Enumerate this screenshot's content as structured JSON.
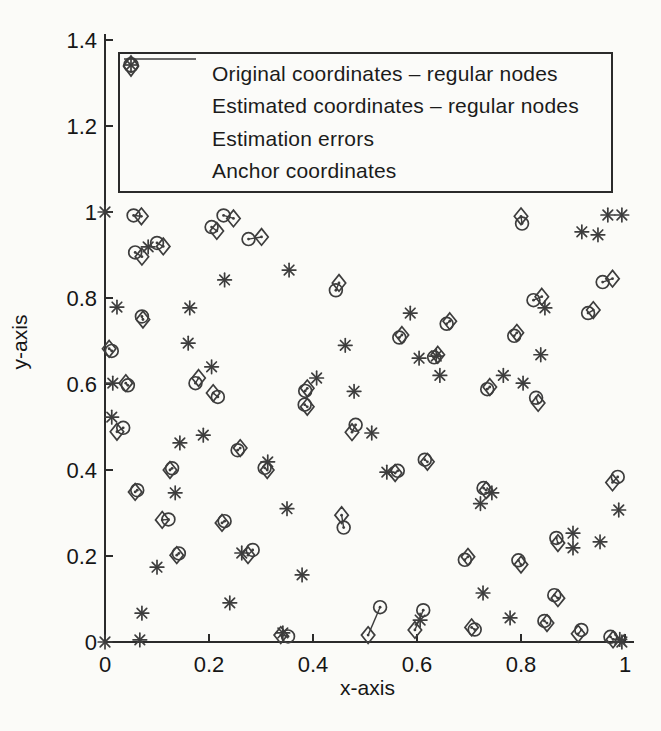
{
  "figure_colors": {
    "background": "#fbfbf8",
    "ink": "#3d3d3d",
    "axis": "#2b2b2b",
    "text": "#161616"
  },
  "chart_data": {
    "type": "scatter",
    "title": "",
    "xlabel": "x-axis",
    "ylabel": "y-axis",
    "xlim": [
      0,
      1.02
    ],
    "ylim": [
      0,
      1.41
    ],
    "grid": false,
    "legend_position": "top-inside",
    "xtick_values": [
      0,
      0.2,
      0.4,
      0.6,
      0.8,
      1
    ],
    "xtick_labels": [
      "0",
      "0.2",
      "0.4",
      "0.6",
      "0.8",
      "1"
    ],
    "ytick_values": [
      0,
      0.2,
      0.4,
      0.6,
      0.8,
      1,
      1.2,
      1.4
    ],
    "ytick_labels": [
      "0",
      "0.2",
      "0.4",
      "0.6",
      "0.8",
      "1",
      "1.2",
      "1.4"
    ],
    "legend_entries": [
      {
        "marker": "diamond",
        "label": "Original coordinates – regular nodes"
      },
      {
        "marker": "circle",
        "label": "Estimated coordinates – regular nodes"
      },
      {
        "marker": "line",
        "label": "Estimation errors"
      },
      {
        "marker": "asterisk",
        "label": "Anchor coordinates"
      }
    ],
    "regular_nodes": [
      {
        "original": [
          0.07,
          0.99
        ],
        "estimated": [
          0.055,
          0.992
        ]
      },
      {
        "original": [
          0.247,
          0.985
        ],
        "estimated": [
          0.228,
          0.992
        ]
      },
      {
        "original": [
          0.215,
          0.956
        ],
        "estimated": [
          0.205,
          0.965
        ]
      },
      {
        "original": [
          0.301,
          0.942
        ],
        "estimated": [
          0.276,
          0.937
        ]
      },
      {
        "original": [
          0.071,
          0.896
        ],
        "estimated": [
          0.058,
          0.906
        ]
      },
      {
        "original": [
          0.112,
          0.92
        ],
        "estimated": [
          0.1,
          0.928
        ]
      },
      {
        "original": [
          0.8,
          0.99
        ],
        "estimated": [
          0.802,
          0.973
        ]
      },
      {
        "original": [
          0.073,
          0.75
        ],
        "estimated": [
          0.071,
          0.757
        ]
      },
      {
        "original": [
          0.008,
          0.682
        ],
        "estimated": [
          0.013,
          0.677
        ]
      },
      {
        "original": [
          0.45,
          0.835
        ],
        "estimated": [
          0.444,
          0.818
        ]
      },
      {
        "original": [
          0.571,
          0.714
        ],
        "estimated": [
          0.566,
          0.708
        ]
      },
      {
        "original": [
          0.663,
          0.746
        ],
        "estimated": [
          0.657,
          0.74
        ]
      },
      {
        "original": [
          0.976,
          0.845
        ],
        "estimated": [
          0.957,
          0.837
        ]
      },
      {
        "original": [
          0.84,
          0.803
        ],
        "estimated": [
          0.824,
          0.795
        ]
      },
      {
        "original": [
          0.939,
          0.772
        ],
        "estimated": [
          0.929,
          0.765
        ]
      },
      {
        "original": [
          0.792,
          0.719
        ],
        "estimated": [
          0.787,
          0.712
        ]
      },
      {
        "original": [
          0.04,
          0.602
        ],
        "estimated": [
          0.044,
          0.597
        ]
      },
      {
        "original": [
          0.18,
          0.614
        ],
        "estimated": [
          0.174,
          0.602
        ]
      },
      {
        "original": [
          0.208,
          0.579
        ],
        "estimated": [
          0.217,
          0.57
        ]
      },
      {
        "original": [
          0.023,
          0.489
        ],
        "estimated": [
          0.035,
          0.498
        ]
      },
      {
        "original": [
          0.26,
          0.451
        ],
        "estimated": [
          0.255,
          0.446
        ]
      },
      {
        "original": [
          0.125,
          0.4
        ],
        "estimated": [
          0.129,
          0.404
        ]
      },
      {
        "original": [
          0.312,
          0.4
        ],
        "estimated": [
          0.307,
          0.405
        ]
      },
      {
        "original": [
          0.058,
          0.349
        ],
        "estimated": [
          0.062,
          0.353
        ]
      },
      {
        "original": [
          0.389,
          0.59
        ],
        "estimated": [
          0.385,
          0.584
        ]
      },
      {
        "original": [
          0.389,
          0.547
        ],
        "estimated": [
          0.384,
          0.552
        ]
      },
      {
        "original": [
          0.475,
          0.488
        ],
        "estimated": [
          0.482,
          0.505
        ]
      },
      {
        "original": [
          0.62,
          0.419
        ],
        "estimated": [
          0.615,
          0.424
        ]
      },
      {
        "original": [
          0.558,
          0.393
        ],
        "estimated": [
          0.563,
          0.398
        ]
      },
      {
        "original": [
          0.64,
          0.668
        ],
        "estimated": [
          0.633,
          0.662
        ]
      },
      {
        "original": [
          0.74,
          0.593
        ],
        "estimated": [
          0.735,
          0.588
        ]
      },
      {
        "original": [
          0.833,
          0.556
        ],
        "estimated": [
          0.829,
          0.568
        ]
      },
      {
        "original": [
          0.733,
          0.353
        ],
        "estimated": [
          0.728,
          0.358
        ]
      },
      {
        "original": [
          0.976,
          0.371
        ],
        "estimated": [
          0.986,
          0.384
        ]
      },
      {
        "original": [
          0.11,
          0.284
        ],
        "estimated": [
          0.122,
          0.285
        ]
      },
      {
        "original": [
          0.225,
          0.277
        ],
        "estimated": [
          0.23,
          0.281
        ]
      },
      {
        "original": [
          0.138,
          0.202
        ],
        "estimated": [
          0.142,
          0.206
        ]
      },
      {
        "original": [
          0.275,
          0.202
        ],
        "estimated": [
          0.284,
          0.214
        ]
      },
      {
        "original": [
          0.455,
          0.295
        ],
        "estimated": [
          0.459,
          0.266
        ]
      },
      {
        "original": [
          0.506,
          0.016
        ],
        "estimated": [
          0.529,
          0.081
        ]
      },
      {
        "original": [
          0.596,
          0.028
        ],
        "estimated": [
          0.612,
          0.074
        ]
      },
      {
        "original": [
          0.338,
          0.016
        ],
        "estimated": [
          0.352,
          0.013
        ]
      },
      {
        "original": [
          0.698,
          0.198
        ],
        "estimated": [
          0.692,
          0.191
        ]
      },
      {
        "original": [
          0.8,
          0.18
        ],
        "estimated": [
          0.795,
          0.19
        ]
      },
      {
        "original": [
          0.871,
          0.23
        ],
        "estimated": [
          0.868,
          0.242
        ]
      },
      {
        "original": [
          0.871,
          0.102
        ],
        "estimated": [
          0.864,
          0.109
        ]
      },
      {
        "original": [
          0.705,
          0.034
        ],
        "estimated": [
          0.711,
          0.029
        ]
      },
      {
        "original": [
          0.85,
          0.044
        ],
        "estimated": [
          0.845,
          0.049
        ]
      },
      {
        "original": [
          0.91,
          0.019
        ],
        "estimated": [
          0.916,
          0.028
        ]
      },
      {
        "original": [
          0.977,
          0.006
        ],
        "estimated": [
          0.972,
          0.012
        ]
      }
    ],
    "anchor_nodes": [
      [
        0.0,
        1.0
      ],
      [
        0.083,
        0.919
      ],
      [
        0.23,
        0.842
      ],
      [
        0.354,
        0.865
      ],
      [
        0.023,
        0.779
      ],
      [
        0.163,
        0.777
      ],
      [
        0.16,
        0.695
      ],
      [
        0.462,
        0.69
      ],
      [
        0.587,
        0.765
      ],
      [
        0.604,
        0.66
      ],
      [
        0.637,
        0.665
      ],
      [
        0.644,
        0.62
      ],
      [
        0.838,
        0.668
      ],
      [
        0.766,
        0.62
      ],
      [
        0.804,
        0.602
      ],
      [
        0.967,
        0.993
      ],
      [
        0.994,
        0.993
      ],
      [
        0.948,
        0.947
      ],
      [
        0.917,
        0.954
      ],
      [
        0.846,
        0.777
      ],
      [
        0.015,
        0.602
      ],
      [
        0.013,
        0.523
      ],
      [
        0.205,
        0.64
      ],
      [
        0.407,
        0.614
      ],
      [
        0.479,
        0.583
      ],
      [
        0.189,
        0.481
      ],
      [
        0.144,
        0.463
      ],
      [
        0.313,
        0.419
      ],
      [
        0.135,
        0.347
      ],
      [
        0.542,
        0.395
      ],
      [
        0.513,
        0.486
      ],
      [
        0.35,
        0.31
      ],
      [
        0.379,
        0.156
      ],
      [
        0.1,
        0.174
      ],
      [
        0.263,
        0.207
      ],
      [
        0.24,
        0.091
      ],
      [
        0.071,
        0.067
      ],
      [
        0.0,
        0.0
      ],
      [
        0.067,
        0.005
      ],
      [
        0.342,
        0.021
      ],
      [
        0.606,
        0.051
      ],
      [
        0.727,
        0.114
      ],
      [
        0.779,
        0.056
      ],
      [
        0.744,
        0.347
      ],
      [
        0.722,
        0.322
      ],
      [
        0.9,
        0.253
      ],
      [
        0.9,
        0.219
      ],
      [
        0.952,
        0.233
      ],
      [
        0.988,
        0.307
      ],
      [
        0.99,
        0.006
      ],
      [
        0.994,
        0.0
      ]
    ]
  }
}
